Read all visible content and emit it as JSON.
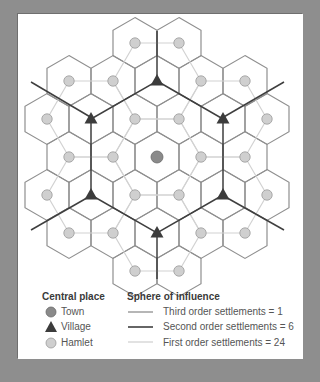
{
  "diagram": {
    "colors": {
      "background": "#8e8e8e",
      "panel": "#ffffff",
      "town_fill": "#8a8a8a",
      "village_fill": "#3c3c3c",
      "hamlet_fill": "#cfcfcf",
      "hamlet_stroke": "#9a9a9a",
      "third_order_line": "#8f8f8f",
      "second_order_line": "#3f3f3f",
      "first_order_line": "#d2d2d2"
    },
    "grid": {
      "center": [
        157,
        157
      ],
      "col_spacing": 44,
      "row_spacing": 38
    },
    "town": [
      0,
      0
    ],
    "villages": [
      [
        0,
        -2
      ],
      [
        -1.5,
        -1
      ],
      [
        1.5,
        -1
      ],
      [
        -1.5,
        1
      ],
      [
        1.5,
        1
      ],
      [
        0,
        2
      ]
    ],
    "hamlets_count": 24,
    "rays": [
      {
        "from": [
          157,
          80
        ],
        "to": [
          157,
          31
        ]
      },
      {
        "from": [
          222,
          118
        ],
        "to": [
          284,
          82
        ]
      },
      {
        "from": [
          222,
          195
        ],
        "to": [
          284,
          230
        ]
      },
      {
        "from": [
          157,
          233
        ],
        "to": [
          157,
          279
        ]
      },
      {
        "from": [
          92,
          195
        ],
        "to": [
          31,
          230
        ]
      },
      {
        "from": [
          92,
          118
        ],
        "to": [
          31,
          82
        ]
      }
    ]
  },
  "legend": {
    "central_place": {
      "title": "Central place",
      "items": [
        {
          "symbol": "town",
          "label": "Town"
        },
        {
          "symbol": "village",
          "label": "Village"
        },
        {
          "symbol": "hamlet",
          "label": "Hamlet"
        }
      ]
    },
    "sphere_of_influence": {
      "title": "Sphere of influence",
      "items": [
        {
          "line": "third",
          "label": "Third order settlements = 1"
        },
        {
          "line": "second",
          "label": "Second order settlements = 6"
        },
        {
          "line": "first",
          "label": "First order settlements = 24"
        }
      ]
    }
  }
}
